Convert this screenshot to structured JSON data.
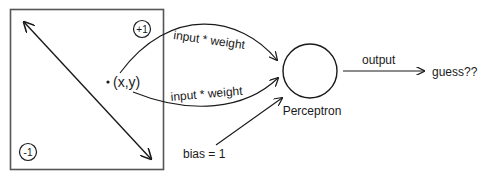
{
  "diagram": {
    "box": {
      "corner_top": "+1",
      "corner_bottom": "-1",
      "point_label": "(x,y)"
    },
    "edges": {
      "input_top": "input * weight",
      "input_bottom": "input * weight",
      "bias": "bias = 1",
      "output": "output"
    },
    "node": {
      "label": "Perceptron"
    },
    "result": "guess??"
  },
  "colors": {
    "stroke": "#1a1a1a",
    "box_stroke": "#555555",
    "background": "#ffffff"
  }
}
